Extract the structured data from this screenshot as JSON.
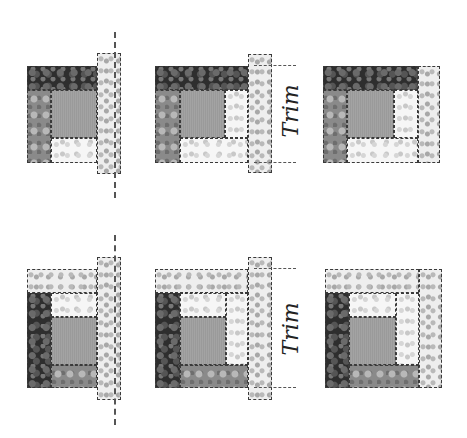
{
  "diagram": {
    "rows": [
      {
        "row": "top",
        "steps": [
          {
            "step": 1,
            "annotation": "cut-line",
            "label": ""
          },
          {
            "step": 2,
            "annotation": "trim-guides",
            "label": "Trim"
          },
          {
            "step": 3,
            "annotation": "finished",
            "label": ""
          }
        ]
      },
      {
        "row": "bottom",
        "steps": [
          {
            "step": 1,
            "annotation": "cut-line",
            "label": ""
          },
          {
            "step": 2,
            "annotation": "trim-guides",
            "label": "Trim"
          },
          {
            "step": 3,
            "annotation": "finished",
            "label": ""
          }
        ]
      }
    ],
    "labels": {
      "trim_top": "Trim",
      "trim_bottom": "Trim"
    },
    "colors": {
      "dark_fabric": "#2e2e2e",
      "medium_fabric": "#8a8a8a",
      "light_fabric": "#f6f6f6",
      "center_square": "#9e9e9e",
      "guide_line": "#555555"
    }
  }
}
